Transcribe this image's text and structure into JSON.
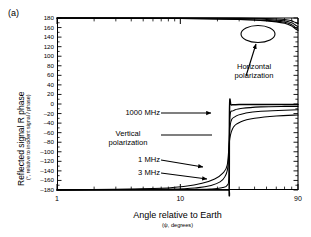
{
  "panel": {
    "label": "(a)"
  },
  "chart_data": {
    "type": "line",
    "title": "",
    "panel_label": "(a)",
    "xlabel": "Angle relative to Earth",
    "xlabel_sub": "(ψ, degrees)",
    "ylabel": "Reflected signal R phase",
    "ylabel_sub": "(°, relative to incident signal / phase)",
    "xscale": "log",
    "xlim": [
      1,
      90
    ],
    "ylim": [
      -180,
      180
    ],
    "xticklabels": [
      "1",
      "10",
      "90"
    ],
    "xtickvalues": [
      1,
      10,
      90
    ],
    "yticklabels": [
      "180",
      "160",
      "140",
      "120",
      "100",
      "80",
      "60",
      "40",
      "20",
      "0",
      "-20",
      "-40",
      "-60",
      "-80",
      "-100",
      "-120",
      "-140",
      "-160",
      "-180"
    ],
    "ytickvalues": [
      180,
      160,
      140,
      120,
      100,
      80,
      60,
      40,
      20,
      0,
      -20,
      -40,
      -60,
      -80,
      -100,
      -120,
      -140,
      -160,
      -180
    ],
    "grid": false,
    "legend": "none",
    "line_color": "#000000",
    "series": [
      {
        "name": "Horizontal polarization 1 MHz",
        "group": "horizontal",
        "frequency_mhz": 1,
        "x": [
          1,
          10,
          30,
          50,
          70,
          80,
          85,
          90
        ],
        "values": [
          180,
          179,
          177,
          174,
          169,
          163,
          158,
          154
        ]
      },
      {
        "name": "Horizontal polarization 3 MHz",
        "group": "horizontal",
        "frequency_mhz": 3,
        "x": [
          1,
          10,
          30,
          50,
          70,
          80,
          85,
          90
        ],
        "values": [
          180,
          179,
          177,
          175,
          171,
          166,
          161,
          157
        ]
      },
      {
        "name": "Horizontal polarization 100 MHz",
        "group": "horizontal",
        "frequency_mhz": 100,
        "x": [
          1,
          10,
          30,
          50,
          70,
          80,
          85,
          90
        ],
        "values": [
          180,
          180,
          179,
          177,
          174,
          170,
          166,
          162
        ]
      },
      {
        "name": "Horizontal polarization 1000 MHz",
        "group": "horizontal",
        "frequency_mhz": 1000,
        "x": [
          1,
          10,
          30,
          50,
          70,
          80,
          85,
          90
        ],
        "values": [
          180,
          180,
          180,
          179,
          177,
          174,
          171,
          168
        ]
      },
      {
        "name": "Vertical polarization 1000 MHz",
        "group": "vertical",
        "frequency_mhz": 1000,
        "x": [
          1,
          10,
          20,
          24.5,
          24.9,
          25.1,
          26,
          30,
          45,
          70,
          90
        ],
        "values": [
          -180,
          -180,
          -180,
          -180,
          -179,
          -3,
          -2,
          -1,
          -1,
          -1,
          -1
        ]
      },
      {
        "name": "Vertical polarization 100 MHz",
        "group": "vertical",
        "frequency_mhz": 100,
        "x": [
          1,
          10,
          18,
          22,
          24,
          24.8,
          25.2,
          27,
          32,
          45,
          70,
          90
        ],
        "values": [
          -180,
          -179,
          -178,
          -175,
          -170,
          -150,
          -30,
          -14,
          -9,
          -6,
          -5,
          -5
        ]
      },
      {
        "name": "Vertical polarization 3 MHz",
        "group": "vertical",
        "frequency_mhz": 3,
        "x": [
          1,
          8,
          14,
          18,
          21,
          23,
          24.4,
          25.4,
          28,
          34,
          45,
          70,
          90
        ],
        "values": [
          -180,
          -178,
          -175,
          -170,
          -163,
          -152,
          -128,
          -44,
          -26,
          -19,
          -15,
          -13,
          -12
        ]
      },
      {
        "name": "Vertical polarization 1 MHz",
        "group": "vertical",
        "frequency_mhz": 1,
        "x": [
          1,
          6,
          11,
          15,
          19,
          22,
          24,
          25.2,
          27,
          31,
          40,
          60,
          90
        ],
        "values": [
          -180,
          -177,
          -172,
          -166,
          -157,
          -145,
          -128,
          -72,
          -48,
          -37,
          -30,
          -25,
          -23
        ]
      }
    ],
    "annotations": [
      {
        "id": "horizontal-polarization",
        "text": "Horizontal\npolarization",
        "line1": "Horizontal",
        "line2": "polarization"
      },
      {
        "id": "vertical-polarization",
        "text": "Vertical\npolarization",
        "line1": "Vertical",
        "line2": "polarization"
      },
      {
        "id": "label-1000mhz",
        "text": "1000 MHz"
      },
      {
        "id": "label-1mhz",
        "text": "1 MHz"
      },
      {
        "id": "label-3mhz",
        "text": "3 MHz"
      }
    ]
  }
}
